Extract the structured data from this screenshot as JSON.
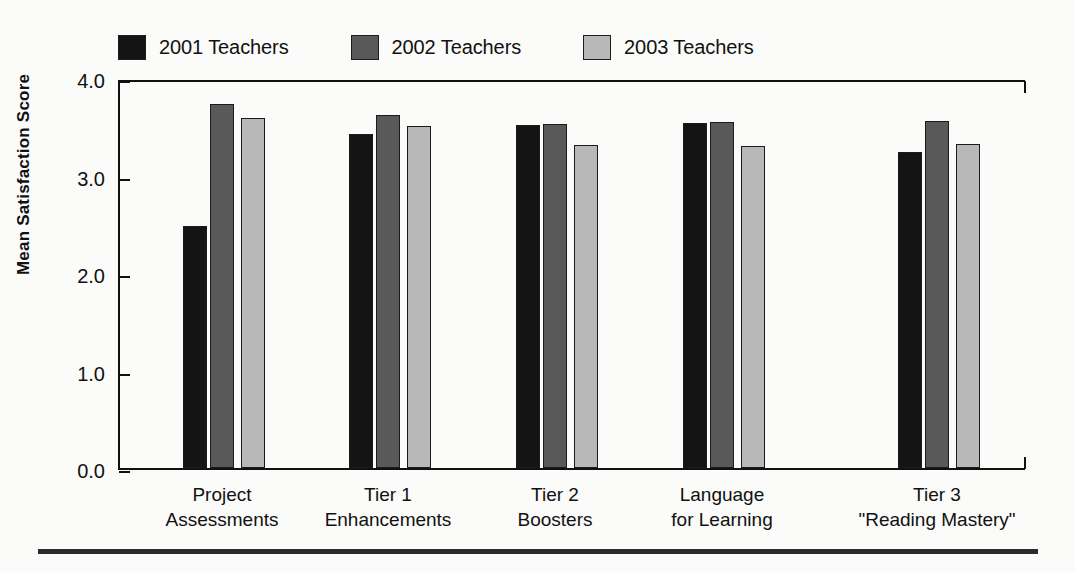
{
  "chart_data": {
    "type": "bar",
    "title": "",
    "xlabel": "",
    "ylabel": "Mean Satisfaction Score",
    "ylim": [
      0.0,
      4.0
    ],
    "ytick_labels": [
      "4.0",
      "3.0",
      "2.0",
      "1.0",
      "0.0"
    ],
    "ytick_values": [
      4.0,
      3.0,
      2.0,
      1.0,
      0.0
    ],
    "grid": false,
    "legend_position": "top",
    "categories": [
      "Project\nAssessments",
      "Tier 1\nEnhancements",
      "Tier 2\nBoosters",
      "Language\nfor Learning",
      "Tier 3\n\"Reading Mastery\""
    ],
    "category_lines": [
      [
        "Project",
        "Assessments"
      ],
      [
        "Tier 1",
        "Enhancements"
      ],
      [
        "Tier 2",
        "Boosters"
      ],
      [
        "Language",
        "for Learning"
      ],
      [
        "Tier 3",
        "\"Reading Mastery\""
      ]
    ],
    "series": [
      {
        "name": "2001 Teachers",
        "color": "#141414",
        "values": [
          2.48,
          3.43,
          3.52,
          3.54,
          3.24
        ]
      },
      {
        "name": "2002 Teachers",
        "color": "#595959",
        "values": [
          3.73,
          3.62,
          3.53,
          3.55,
          3.56
        ]
      },
      {
        "name": "2003 Teachers",
        "color": "#b8b8b8",
        "values": [
          3.59,
          3.51,
          3.31,
          3.3,
          3.32
        ]
      }
    ]
  },
  "legend": {
    "items": [
      {
        "label": "2001 Teachers",
        "color": "#141414"
      },
      {
        "label": "2002 Teachers",
        "color": "#595959"
      },
      {
        "label": "2003 Teachers",
        "color": "#b8b8b8"
      }
    ]
  },
  "axis": {
    "y_title": "Mean Satisfaction Score"
  }
}
